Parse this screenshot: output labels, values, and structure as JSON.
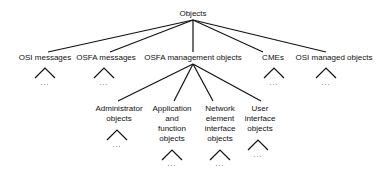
{
  "root": {
    "label": "Objects"
  },
  "level1": [
    {
      "label": "OSI messages",
      "has_subtree": true,
      "ellipsis": "..."
    },
    {
      "label": "OSFA messages",
      "has_subtree": true,
      "ellipsis": "..."
    },
    {
      "label": "OSFA management objects",
      "has_subtree": false
    },
    {
      "label": "CMEs",
      "has_subtree": true,
      "ellipsis": "..."
    },
    {
      "label": "OSI managed objects",
      "has_subtree": true,
      "ellipsis": "..."
    }
  ],
  "level2": [
    {
      "parent": "OSFA management objects",
      "lines": [
        "Administrator",
        "objects"
      ],
      "ellipsis": "..."
    },
    {
      "parent": "OSFA management objects",
      "lines": [
        "Application",
        "and",
        "function",
        "objects"
      ],
      "ellipsis": "..."
    },
    {
      "parent": "OSFA management objects",
      "lines": [
        "Network",
        "element",
        "interface",
        "objects"
      ],
      "ellipsis": "..."
    },
    {
      "parent": "OSFA management objects",
      "lines": [
        "User",
        "interface",
        "objects"
      ],
      "ellipsis": "..."
    }
  ],
  "colors": {
    "line": "#111111",
    "text": "#111111",
    "background": "#ffffff"
  }
}
